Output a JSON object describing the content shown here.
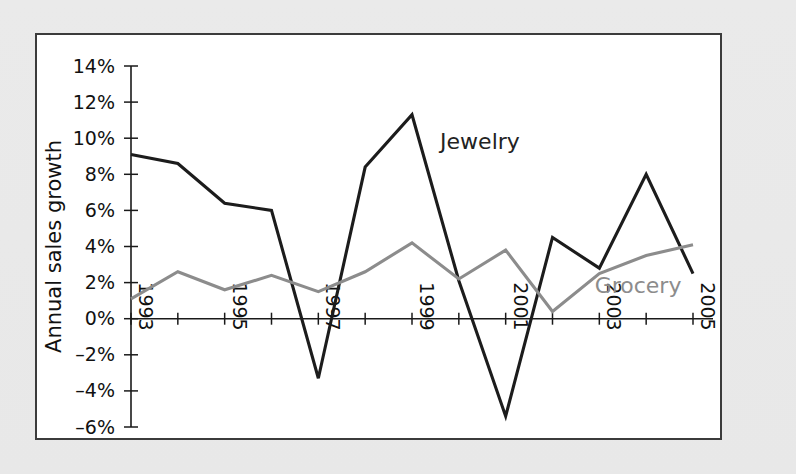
{
  "figure": {
    "background_color": "#e9e9e9",
    "plot_background_color": "#ffffff",
    "frame_border_color": "#3b3b3b"
  },
  "chart_data": {
    "type": "line",
    "title": "",
    "xlabel": "",
    "ylabel": "Annual sales growth",
    "ylim": [
      -6,
      14
    ],
    "ytick_values": [
      14,
      12,
      10,
      8,
      6,
      4,
      2,
      0,
      -2,
      -4,
      -6
    ],
    "ytick_labels": [
      "14%",
      "12%",
      "10%",
      "8%",
      "6%",
      "4%",
      "2%",
      "0%",
      "–2%",
      "–4%",
      "–6%"
    ],
    "xlim": [
      1993,
      2005
    ],
    "x": [
      1993,
      1994,
      1995,
      1996,
      1997,
      1998,
      1999,
      2000,
      2001,
      2002,
      2003,
      2004,
      2005
    ],
    "xtick_values": [
      1993,
      1994,
      1995,
      1996,
      1997,
      1998,
      1999,
      2000,
      2001,
      2002,
      2003,
      2004,
      2005
    ],
    "xtick_labels_shown": [
      "1993",
      "1995",
      "1997",
      "1999",
      "2001",
      "2003",
      "2005"
    ],
    "xtick_label_rotation": 90,
    "grid": false,
    "legend_position": "inline-annotation",
    "series": [
      {
        "name": "Jewelry",
        "color": "#1c1c1c",
        "label_x": 1999.6,
        "label_y": 9.4,
        "values": [
          9.1,
          8.6,
          6.4,
          6.0,
          -3.3,
          8.4,
          11.3,
          2.1,
          -5.4,
          4.5,
          2.8,
          8.0,
          2.5
        ]
      },
      {
        "name": "Grocery",
        "color": "#8c8c8c",
        "label_x": 2002.9,
        "label_y": 1.4,
        "values": [
          1.1,
          2.6,
          1.6,
          2.4,
          1.5,
          2.6,
          4.2,
          2.2,
          3.8,
          0.4,
          2.5,
          3.5,
          4.1
        ]
      }
    ]
  }
}
